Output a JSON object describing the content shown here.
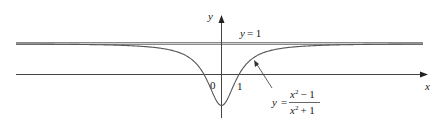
{
  "chart_data": {
    "type": "line",
    "title": "",
    "function": "y = (x^2 - 1)/(x^2 + 1)",
    "xlabel": "x",
    "ylabel": "y",
    "xlim": [
      -10.7,
      11.4
    ],
    "ylim": [
      -1.4,
      2.3
    ],
    "grid": false,
    "tick_labels": {
      "origin": "0",
      "x_tick": "1"
    },
    "asymptote": {
      "label": "y = 1",
      "value": 1
    },
    "annotations": [
      {
        "text": "y = (x² − 1)/(x² + 1)",
        "points_to": "curve right branch"
      }
    ],
    "key_points": [
      {
        "x": -1,
        "y": 0
      },
      {
        "x": 0,
        "y": -1
      },
      {
        "x": 1,
        "y": 0
      }
    ]
  },
  "labels": {
    "y_axis": "y",
    "x_axis": "x",
    "origin": "0",
    "one": "1",
    "asymptote_y": "y",
    "asymptote_eq": "= 1",
    "formula_y": "y",
    "formula_eq": "=",
    "numerator": "x",
    "numerator_rest": "− 1",
    "denominator": "x",
    "denominator_rest": "+ 1",
    "exp": "2"
  },
  "colors": {
    "axis": "#333333",
    "curve": "#555555",
    "asymptote": "#999999"
  }
}
